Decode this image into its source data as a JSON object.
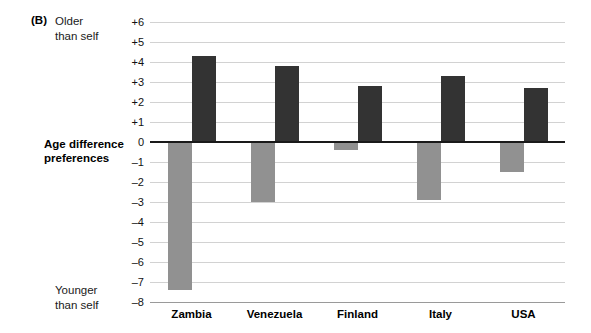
{
  "panel": {
    "label": "(B)",
    "top_note": "Older\nthan self",
    "bottom_note": "Younger\nthan self",
    "axis_title": "Age difference\npreferences"
  },
  "colors": {
    "positive_bar": "#333333",
    "negative_bar": "#919191",
    "gridline": "#d2d2d2",
    "zero_line": "#1a1a1a"
  },
  "chart_data": {
    "type": "bar",
    "title": "",
    "xlabel": "",
    "ylabel": "Age difference preferences",
    "ylim": [
      -8,
      6
    ],
    "yticks": [
      "+6",
      "+5",
      "+4",
      "+3",
      "+2",
      "+1",
      "0",
      "–1",
      "–2",
      "–3",
      "–4",
      "–5",
      "–6",
      "–7",
      "–8"
    ],
    "ytick_values": [
      6,
      5,
      4,
      3,
      2,
      1,
      0,
      -1,
      -2,
      -3,
      -4,
      -5,
      -6,
      -7,
      -8
    ],
    "grid": true,
    "legend_position": "none",
    "categories": [
      "Zambia",
      "Venezuela",
      "Finland",
      "Italy",
      "USA"
    ],
    "series": [
      {
        "name": "Younger than self",
        "color": "#919191",
        "values": [
          -7.4,
          -3.0,
          -0.4,
          -2.9,
          -1.5
        ]
      },
      {
        "name": "Older than self",
        "color": "#333333",
        "values": [
          4.3,
          3.8,
          2.8,
          3.3,
          2.7
        ]
      }
    ],
    "annotations": [
      "(B)",
      "Older than self",
      "Younger than self"
    ]
  }
}
